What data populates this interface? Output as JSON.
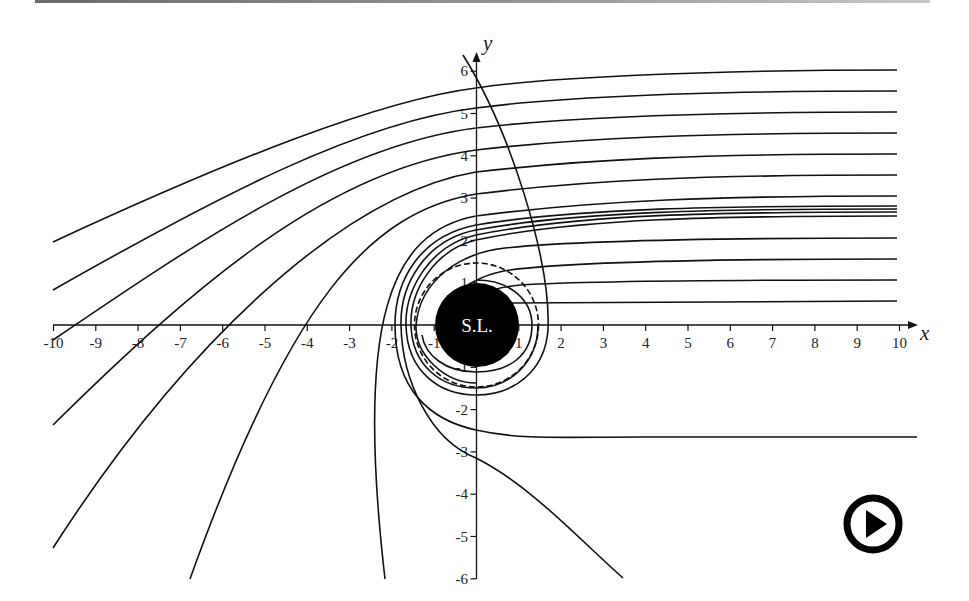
{
  "figure": {
    "black_hole_label": "S.L.",
    "x_axis_label": "x",
    "y_axis_label": "y",
    "x_ticks": [
      "-10",
      "-9",
      "-8",
      "-7",
      "-6",
      "-5",
      "-4",
      "-3",
      "-2",
      "-1",
      "1",
      "2",
      "3",
      "4",
      "5",
      "6",
      "7",
      "8",
      "9",
      "10"
    ],
    "y_ticks": [
      "-6",
      "-5",
      "-4",
      "-3",
      "-2",
      "-1",
      "1",
      "2",
      "3",
      "4",
      "5",
      "6"
    ],
    "x_range": [
      -10,
      10
    ],
    "y_range": [
      -6,
      6
    ],
    "black_hole_radius": 1,
    "photon_sphere_radius": 1.5,
    "incoming_ray_impact_parameters": [
      6.03,
      5.53,
      5.04,
      4.54,
      4.04,
      3.55,
      3.05,
      2.81,
      2.74,
      2.67,
      2.58,
      2.06,
      1.56,
      1.06,
      0.57
    ],
    "colors": {
      "ink": "#111111",
      "background": "#ffffff",
      "disk": "#000000",
      "label": "#ffffff"
    }
  },
  "controls": {
    "play_button": {
      "icon": "play-icon",
      "label": "Play animation"
    }
  }
}
